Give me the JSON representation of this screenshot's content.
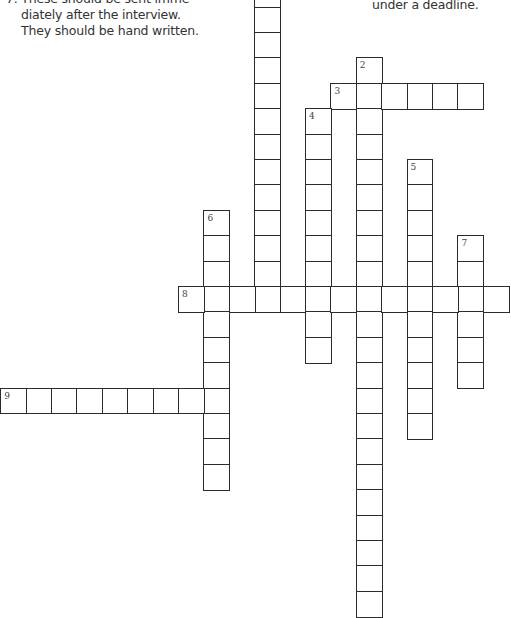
{
  "clues": {
    "left_fragment": "7. These should be sent imme-\n    diately after the interview.\n    They should be hand written.",
    "right_fragment": "under a deadline."
  },
  "grid_geometry": {
    "pitch": 25.4,
    "origin_x": 178,
    "origin_y": 286
  },
  "words": [
    {
      "id": "1",
      "label": "",
      "direction": "down",
      "col": 3,
      "row": -12,
      "length": 13
    },
    {
      "id": "2",
      "label": "2",
      "direction": "down",
      "col": 7,
      "row": -9,
      "length": 22
    },
    {
      "id": "3",
      "label": "3",
      "direction": "across",
      "col": 6,
      "row": -8,
      "length": 6
    },
    {
      "id": "4",
      "label": "4",
      "direction": "down",
      "col": 5,
      "row": -7,
      "length": 10
    },
    {
      "id": "5",
      "label": "5",
      "direction": "down",
      "col": 9,
      "row": -5,
      "length": 11
    },
    {
      "id": "6",
      "label": "6",
      "direction": "down",
      "col": 1,
      "row": -3,
      "length": 11
    },
    {
      "id": "7",
      "label": "7",
      "direction": "down",
      "col": 11,
      "row": -2,
      "length": 6
    },
    {
      "id": "8",
      "label": "8",
      "direction": "across",
      "col": 0,
      "row": 0,
      "length": 13
    },
    {
      "id": "9",
      "label": "9",
      "direction": "across",
      "col": -7,
      "row": 4,
      "length": 9
    }
  ]
}
